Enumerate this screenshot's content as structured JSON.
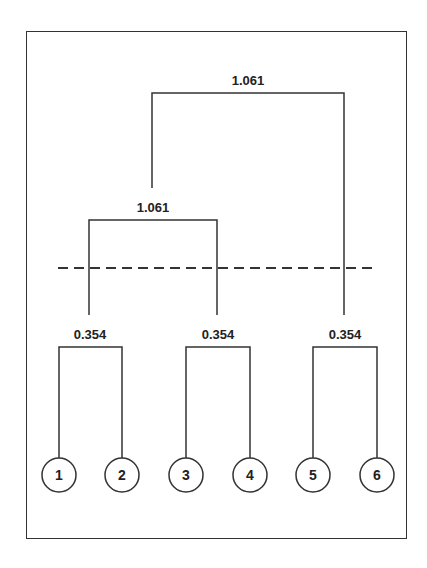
{
  "diagram": {
    "type": "dendrogram",
    "leaves": [
      "1",
      "2",
      "3",
      "4",
      "5",
      "6"
    ],
    "merges": [
      {
        "label": "0.354",
        "members": [
          "1",
          "2"
        ]
      },
      {
        "label": "0.354",
        "members": [
          "3",
          "4"
        ]
      },
      {
        "label": "0.354",
        "members": [
          "5",
          "6"
        ]
      },
      {
        "label": "1.061",
        "members": [
          "1,2",
          "3,4"
        ]
      },
      {
        "label": "1.061",
        "members": [
          "1,2,3,4",
          "5,6"
        ]
      }
    ],
    "cut_line": "dashed"
  },
  "colors": {
    "line": "#333333",
    "text": "#222222",
    "background": "#ffffff"
  }
}
